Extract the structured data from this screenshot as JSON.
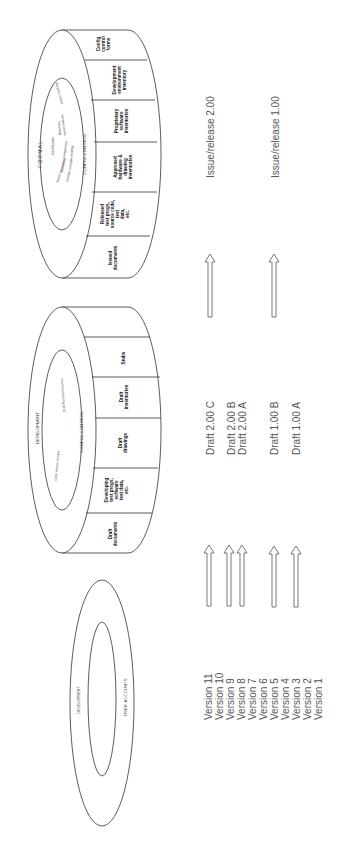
{
  "formal_ring": {
    "outer_label": "FORMAL",
    "band_label": "CONFIG  CONTROL",
    "inner_items": [
      "Status accounting",
      "Identification",
      "Release management",
      "Baselines",
      "Change control",
      "Impact analysis",
      "On auditing",
      "Defect Tracking"
    ],
    "cells": [
      {
        "lines": [
          "Issued",
          "documents"
        ]
      },
      {
        "lines": [
          "Released",
          "test progs,",
          "source code,",
          "test",
          "data,",
          "etc."
        ]
      },
      {
        "lines": [
          "Approved",
          "hardware &",
          "drawing",
          "inventories"
        ]
      },
      {
        "lines": [
          "Proprietary",
          "software",
          "inventories"
        ]
      },
      {
        "lines": [
          "Development",
          "environment",
          "inventory"
        ]
      },
      {
        "lines": [
          "Config",
          "control",
          "forms"
        ]
      }
    ]
  },
  "development_ring": {
    "outer_label": "DEVELOPMENT",
    "band_label": "CONFIG  CONTROL",
    "inner_items": [
      "Code Version Control",
      "Draft Document Control"
    ],
    "cells": [
      {
        "lines": [
          "Draft",
          "documents"
        ]
      },
      {
        "lines": [
          "Developing",
          "test progs,",
          "software",
          "test data,",
          "etc."
        ]
      },
      {
        "lines": [
          "Draft",
          "drawings"
        ]
      },
      {
        "lines": [
          "Draft",
          "inventories"
        ]
      },
      {
        "lines": [
          "Stubs"
        ]
      }
    ]
  },
  "user_ring": {
    "outer_label": "DEVELOPMENT",
    "inner_label": "USER   ACCOUNTS"
  },
  "releases": [
    "Issue/release 2.00",
    "Issue/release 1.00"
  ],
  "drafts": [
    "Draft 2.00 C",
    "Draft 2.00 B",
    "Draft 2.00 A",
    "Draft 1.00 B",
    "Draft 1.00 A"
  ],
  "versions": [
    "Version 11",
    "Version 10",
    "Version 9",
    "Version 8",
    "Version 7",
    "Version 6",
    "Version 5",
    "Version 4",
    "Version 3",
    "Version 2",
    "Version 1"
  ]
}
